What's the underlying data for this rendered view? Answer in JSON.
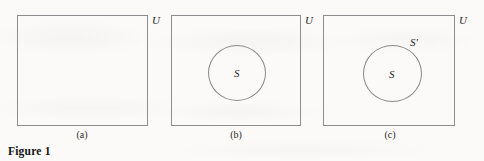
{
  "figure": {
    "caption": "Figure 1",
    "panels": [
      {
        "id": "a",
        "subcaption": "(a)",
        "universe_label": "U",
        "has_set": false,
        "set_label": "",
        "complement_label": ""
      },
      {
        "id": "b",
        "subcaption": "(b)",
        "universe_label": "U",
        "has_set": true,
        "set_label": "S",
        "complement_label": ""
      },
      {
        "id": "c",
        "subcaption": "(c)",
        "universe_label": "U",
        "has_set": true,
        "set_label": "S",
        "complement_label": "S'"
      }
    ]
  },
  "colors": {
    "page_background": "#fbfaf8",
    "box_stroke": "#8d8d90",
    "circle_stroke": "#8a8a8d",
    "text": "#1b1b1b"
  }
}
